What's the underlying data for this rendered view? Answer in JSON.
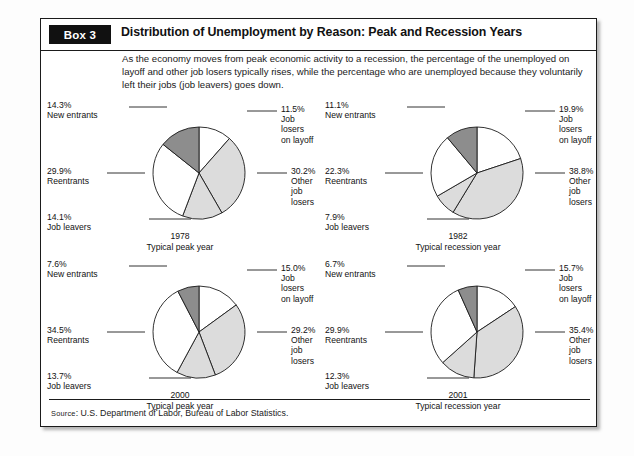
{
  "box": {
    "tag": "Box 3",
    "title": "Distribution of Unemployment by Reason: Peak and Recession Years",
    "intro": "As the economy moves from peak economic activity to a recession, the percentage of the unemployed on layoff and other job losers typically rises, while the percentage who are unemployed because they voluntarily left their jobs (job leavers) goes down.",
    "source_prefix": "Source",
    "source_text": ": U.S. Department of Labor, Bureau of Labor Statistics."
  },
  "colors": {
    "dark_gray": "#8d8d8d",
    "light_gray": "#dcdcdc",
    "white": "#ffffff",
    "stroke": "#1b1b1b",
    "tag_bg": "#111111"
  },
  "chart_data": [
    {
      "type": "pie",
      "title": "1978",
      "subtitle": "Typical peak year",
      "categories": [
        "Job losers on layoff",
        "Other job losers",
        "Job leavers",
        "Reentrants",
        "New entrants"
      ],
      "values": [
        11.5,
        30.2,
        14.1,
        29.9,
        14.3
      ],
      "value_labels": [
        "11.5%",
        "30.2%",
        "14.1%",
        "29.9%",
        "14.3%"
      ],
      "label_lines": [
        [
          "11.5%",
          "Job losers",
          "on layoff"
        ],
        [
          "30.2%",
          "Other job",
          "losers"
        ],
        [
          "14.1%",
          "Job leavers"
        ],
        [
          "29.9%",
          "Reentrants"
        ],
        [
          "14.3%",
          "New entrants"
        ]
      ],
      "fills": [
        "white",
        "light_gray",
        "light_gray",
        "white",
        "dark_gray"
      ],
      "legend": "none"
    },
    {
      "type": "pie",
      "title": "1982",
      "subtitle": "Typical recession year",
      "categories": [
        "Job losers on layoff",
        "Other job losers",
        "Job leavers",
        "Reentrants",
        "New entrants"
      ],
      "values": [
        19.9,
        38.8,
        7.9,
        22.3,
        11.1
      ],
      "value_labels": [
        "19.9%",
        "38.8%",
        "7.9%",
        "22.3%",
        "11.1%"
      ],
      "label_lines": [
        [
          "19.9%",
          "Job losers",
          "on layoff"
        ],
        [
          "38.8%",
          "Other job",
          "losers"
        ],
        [
          "7.9%",
          "Job leavers"
        ],
        [
          "22.3%",
          "Reentrants"
        ],
        [
          "11.1%",
          "New entrants"
        ]
      ],
      "fills": [
        "white",
        "light_gray",
        "light_gray",
        "white",
        "dark_gray"
      ],
      "legend": "none"
    },
    {
      "type": "pie",
      "title": "2000",
      "subtitle": "Typical peak year",
      "categories": [
        "Job losers on layoff",
        "Other job losers",
        "Job leavers",
        "Reentrants",
        "New entrants"
      ],
      "values": [
        15.0,
        29.2,
        13.7,
        34.5,
        7.6
      ],
      "value_labels": [
        "15.0%",
        "29.2%",
        "13.7%",
        "34.5%",
        "7.6%"
      ],
      "label_lines": [
        [
          "15.0%",
          "Job losers",
          "on layoff"
        ],
        [
          "29.2%",
          "Other job",
          "losers"
        ],
        [
          "13.7%",
          "Job leavers"
        ],
        [
          "34.5%",
          "Reentrants"
        ],
        [
          "7.6%",
          "New entrants"
        ]
      ],
      "fills": [
        "white",
        "light_gray",
        "light_gray",
        "white",
        "dark_gray"
      ],
      "legend": "none"
    },
    {
      "type": "pie",
      "title": "2001",
      "subtitle": "Typical recession year",
      "categories": [
        "Job losers on layoff",
        "Other job losers",
        "Job leavers",
        "Reentrants",
        "New entrants"
      ],
      "values": [
        15.7,
        35.4,
        12.3,
        29.9,
        6.7
      ],
      "value_labels": [
        "15.7%",
        "35.4%",
        "12.3%",
        "29.9%",
        "6.7%"
      ],
      "label_lines": [
        [
          "15.7%",
          "Job losers",
          "on layoff"
        ],
        [
          "35.4%",
          "Other job",
          "losers"
        ],
        [
          "12.3%",
          "Job leavers"
        ],
        [
          "29.9%",
          "Reentrants"
        ],
        [
          "6.7%",
          "New entrants"
        ]
      ],
      "fills": [
        "white",
        "light_gray",
        "light_gray",
        "white",
        "dark_gray"
      ],
      "legend": "none"
    }
  ]
}
